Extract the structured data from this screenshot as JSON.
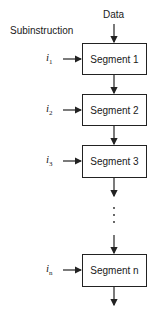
{
  "diagram": {
    "top_label": "Data",
    "side_header": "Subinstruction",
    "segments": [
      {
        "label": "Segment 1",
        "input_var": "i",
        "input_sub": "1"
      },
      {
        "label": "Segment 2",
        "input_var": "i",
        "input_sub": "2"
      },
      {
        "label": "Segment 3",
        "input_var": "i",
        "input_sub": "3"
      },
      {
        "label": "Segment n",
        "input_var": "i",
        "input_sub": "n"
      }
    ],
    "ellipsis": "⋮"
  }
}
